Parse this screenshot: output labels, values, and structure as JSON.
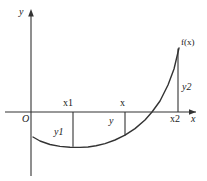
{
  "figure": {
    "kind": "math-function-graph",
    "background_color": "#ffffff",
    "stroke_color": "#333333",
    "text_color": "#1a1a1a"
  },
  "axes": {
    "y_axis_label": "y",
    "x_axis_label": "x",
    "origin_label": "O",
    "y_axis_x_px": 31,
    "x_axis_y_px": 112,
    "x_axis_start_px": 5,
    "x_axis_end_px": 197,
    "y_axis_top_px": 10,
    "y_axis_bottom_px": 176
  },
  "curve": {
    "label": "f(x)",
    "points_px": [
      [
        33,
        137
      ],
      [
        40,
        141
      ],
      [
        50,
        144.5
      ],
      [
        60,
        146.4
      ],
      [
        70,
        147.2
      ],
      [
        80,
        147.4
      ],
      [
        88,
        147.0
      ],
      [
        96,
        145.8
      ],
      [
        105,
        143.6
      ],
      [
        115,
        140.0
      ],
      [
        125,
        135.2
      ],
      [
        135,
        128.6
      ],
      [
        145,
        120.0
      ],
      [
        152,
        112.0
      ],
      [
        160,
        101.0
      ],
      [
        168,
        85.0
      ],
      [
        174,
        69.0
      ],
      [
        179,
        48.0
      ]
    ]
  },
  "markers": [
    {
      "id": "x1",
      "x_label": "x1",
      "y_label": "y1",
      "x_px": 73,
      "y_top_px": 112,
      "y_bottom_px": 146.8,
      "x_label_pos": {
        "left": 63,
        "top": 98
      },
      "y_label_pos": {
        "left": 54,
        "top": 127
      },
      "y_label_side": "left",
      "value_sign": "negative"
    },
    {
      "id": "x",
      "x_label": "x",
      "y_label": "y",
      "x_px": 125,
      "y_top_px": 112,
      "y_bottom_px": 135.4,
      "x_label_pos": {
        "left": 120,
        "top": 98
      },
      "y_label_pos": {
        "left": 109,
        "top": 116
      },
      "y_label_side": "left",
      "value_sign": "negative"
    },
    {
      "id": "x2",
      "x_label": "x2",
      "y_label": "y2",
      "x_px": 178,
      "y_top_px": 48.5,
      "y_bottom_px": 112,
      "x_label_pos": {
        "left": 170,
        "top": 114
      },
      "y_label_pos": {
        "left": 182,
        "top": 82
      },
      "y_label_side": "right",
      "value_sign": "positive"
    }
  ],
  "labels": {
    "y_axis": "y",
    "x_axis": "x",
    "origin": "O",
    "function": "f(x)",
    "x1": "x1",
    "y1": "y1",
    "x_mid": "x",
    "y_mid": "y",
    "x2": "x2",
    "y2": "y2"
  }
}
